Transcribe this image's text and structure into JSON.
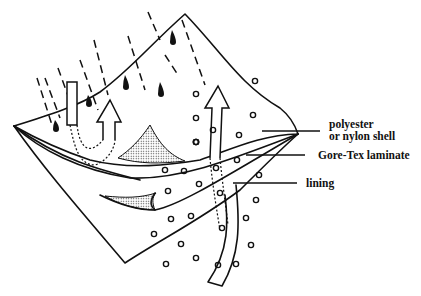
{
  "diagram": {
    "labels": [
      {
        "id": "shell",
        "line1": "polyester",
        "line2": "or nylon shell"
      },
      {
        "id": "laminate",
        "line1": "Gore-Tex laminate"
      },
      {
        "id": "lining",
        "line1": "lining"
      }
    ],
    "colors": {
      "stroke": "#111111",
      "background": "#ffffff",
      "stipple": "#555555"
    }
  }
}
